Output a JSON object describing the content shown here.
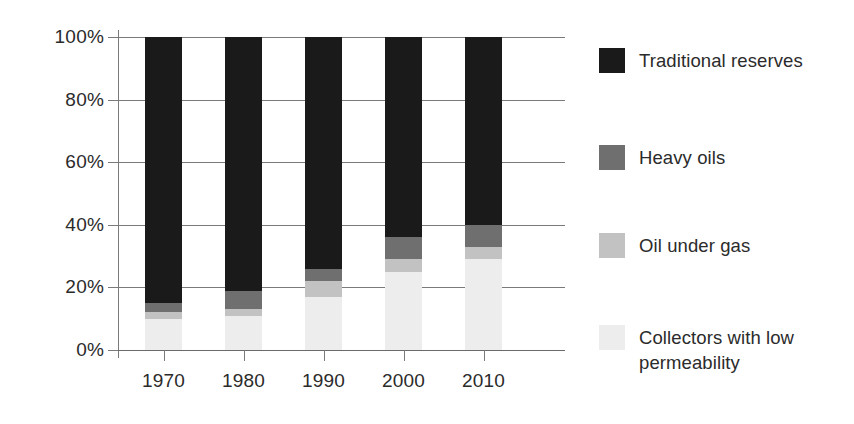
{
  "chart_data": {
    "type": "bar",
    "subtype": "stacked-percent",
    "title": "",
    "xlabel": "",
    "ylabel": "",
    "categories": [
      "1970",
      "1980",
      "1990",
      "2000",
      "2010"
    ],
    "ylim": [
      0,
      100
    ],
    "y_ticks": [
      "0%",
      "20%",
      "40%",
      "60%",
      "80%",
      "100%"
    ],
    "y_tick_values": [
      0,
      20,
      40,
      60,
      80,
      100
    ],
    "grid": true,
    "legend_position": "right",
    "stack_order_bottom_to_top": [
      "Collectors with low permeability",
      "Oil under gas",
      "Heavy oils",
      "Traditional reserves"
    ],
    "series": [
      {
        "name": "Collectors with low permeability",
        "color": "#ededed",
        "values": [
          10,
          11,
          17,
          25,
          29
        ]
      },
      {
        "name": "Oil under gas",
        "color": "#c2c2c2",
        "values": [
          2,
          2,
          5,
          4,
          4
        ]
      },
      {
        "name": "Heavy oils",
        "color": "#6f6f6f",
        "values": [
          3,
          6,
          4,
          7,
          7
        ]
      },
      {
        "name": "Traditional reserves",
        "color": "#1a1a1a",
        "values": [
          85,
          81,
          74,
          64,
          60
        ]
      }
    ],
    "cumulative_tops": {
      "1970": {
        "collectors": 10,
        "oil_under_gas": 12,
        "heavy_oils": 15,
        "traditional": 100
      },
      "1980": {
        "collectors": 11,
        "oil_under_gas": 13,
        "heavy_oils": 19,
        "traditional": 100
      },
      "1990": {
        "collectors": 17,
        "oil_under_gas": 22,
        "heavy_oils": 26,
        "traditional": 100
      },
      "2000": {
        "collectors": 25,
        "oil_under_gas": 29,
        "heavy_oils": 36,
        "traditional": 100
      },
      "2010": {
        "collectors": 29,
        "oil_under_gas": 33,
        "heavy_oils": 40,
        "traditional": 100
      }
    }
  },
  "axis": {
    "y_labels": [
      "100%",
      "80%",
      "60%",
      "40%",
      "20%",
      "0%"
    ],
    "x_labels": [
      "1970",
      "1980",
      "1990",
      "2000",
      "2010"
    ]
  },
  "legend": {
    "items": [
      {
        "label": "Traditional reserves",
        "color": "#1a1a1a"
      },
      {
        "label": "Heavy oils",
        "color": "#6f6f6f"
      },
      {
        "label": "Oil under gas",
        "color": "#c2c2c2"
      },
      {
        "label": "Collectors with low\npermeability",
        "color": "#ededed"
      }
    ]
  },
  "colors": {
    "background": "#ffffff",
    "grid": "#7a7a7a",
    "text": "#2b2b2b"
  }
}
